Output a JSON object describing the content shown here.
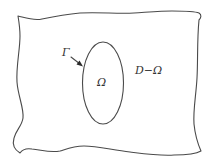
{
  "diagram": {
    "labels": {
      "boundary": "Γ",
      "inner_region": "Ω",
      "outer_region": "D−Ω"
    },
    "colors": {
      "stroke": "#4a4a4a",
      "text": "#333333",
      "background": "#ffffff"
    }
  }
}
